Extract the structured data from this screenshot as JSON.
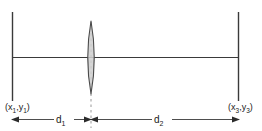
{
  "diagram": {
    "type": "optical-ray-diagram",
    "background_color": "#ffffff",
    "line_color": "#3a3a3a",
    "lens_fill_color": "#cfcfcf",
    "lens_stroke_color": "#4a4a4a",
    "text_color": "#1a1a1a",
    "object_plane": {
      "label_open": "(",
      "label_x": "x",
      "label_x_sub": "1",
      "label_comma": ",",
      "label_y": "y",
      "label_y_sub": "1",
      "label_close": ")",
      "label_full": "(x1,y1)"
    },
    "image_plane": {
      "label_open": "(",
      "label_x": "x",
      "label_x_sub": "3",
      "label_comma": ",",
      "label_y": "y",
      "label_y_sub": "3",
      "label_close": ")",
      "label_full": "(x3,y3)"
    },
    "distances": [
      {
        "name": "object-distance",
        "symbol": "d",
        "subscript": "1",
        "label_full": "d1"
      },
      {
        "name": "image-distance",
        "symbol": "d",
        "subscript": "2",
        "label_full": "d2"
      }
    ],
    "lens": {
      "name": "converging-lens",
      "shape": "biconvex"
    },
    "optical_axis": {
      "name": "optical-axis"
    }
  }
}
